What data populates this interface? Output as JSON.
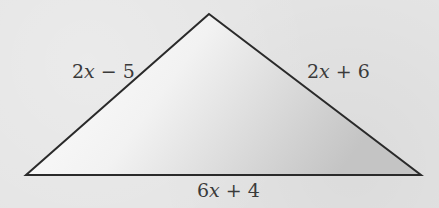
{
  "figure": {
    "type": "triangle",
    "vertices": {
      "apex": [
        209,
        14
      ],
      "left": [
        26,
        175
      ],
      "right": [
        421,
        175
      ]
    },
    "colors": {
      "background": "#e4e4e4",
      "stroke": "#2a2a2a",
      "fill_light": "#ffffff",
      "fill_dark": "#c8c8c8"
    },
    "labels": {
      "left_side": {
        "coef": "2",
        "var": "x",
        "rest": " − 5"
      },
      "right_side": {
        "coef": "2",
        "var": "x",
        "rest": " + 6"
      },
      "base": {
        "coef": "6",
        "var": "x",
        "rest": " + 4"
      }
    }
  }
}
